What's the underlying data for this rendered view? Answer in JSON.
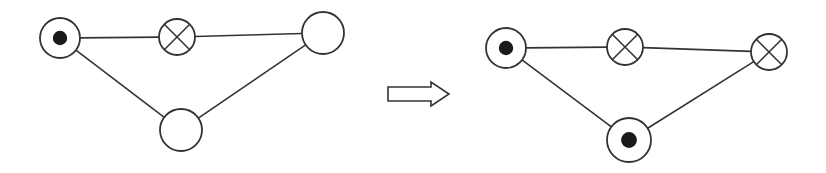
{
  "diagram": {
    "title": "",
    "stroke_color": "#333333",
    "fill_color": "#ffffff",
    "dot_color": "#1a1a1a",
    "before": {
      "nodes": [
        {
          "id": "A",
          "x": 60,
          "y": 38,
          "r": 20,
          "type": "dot"
        },
        {
          "id": "B",
          "x": 177,
          "y": 37,
          "r": 18,
          "type": "cross"
        },
        {
          "id": "C",
          "x": 323,
          "y": 33,
          "r": 21,
          "type": "empty"
        },
        {
          "id": "D",
          "x": 181,
          "y": 130,
          "r": 21,
          "type": "empty"
        }
      ],
      "edges": [
        [
          "A",
          "B"
        ],
        [
          "B",
          "C"
        ],
        [
          "A",
          "D"
        ],
        [
          "D",
          "C"
        ]
      ]
    },
    "arrow": {
      "direction": "right",
      "x1": 388,
      "x2": 449,
      "y": 94
    },
    "after": {
      "nodes": [
        {
          "id": "A",
          "x": 506,
          "y": 48,
          "r": 20,
          "type": "dot"
        },
        {
          "id": "B",
          "x": 625,
          "y": 47,
          "r": 18,
          "type": "cross"
        },
        {
          "id": "C",
          "x": 769,
          "y": 52,
          "r": 18,
          "type": "cross"
        },
        {
          "id": "D",
          "x": 629,
          "y": 140,
          "r": 22,
          "type": "dot"
        }
      ],
      "edges": [
        [
          "A",
          "B"
        ],
        [
          "B",
          "C"
        ],
        [
          "A",
          "D"
        ],
        [
          "D",
          "C"
        ]
      ]
    }
  }
}
